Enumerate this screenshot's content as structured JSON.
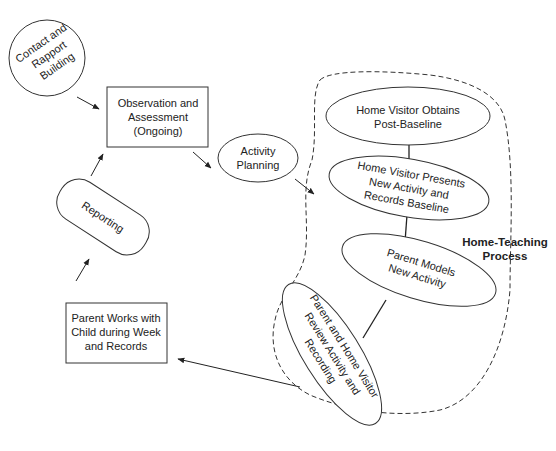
{
  "diagram": {
    "nodes": {
      "contact": {
        "lines": [
          "Contact and",
          "Rapport",
          "Building"
        ]
      },
      "observation": {
        "lines": [
          "Observation and",
          "Assessment",
          "(Ongoing)"
        ]
      },
      "activity_planning": {
        "lines": [
          "Activity",
          "Planning"
        ]
      },
      "reporting": {
        "lines": [
          "Reporting"
        ]
      },
      "parent_works": {
        "lines": [
          "Parent Works with",
          "Child during Week",
          "and Records"
        ]
      },
      "post_baseline": {
        "lines": [
          "Home Visitor Obtains",
          "Post-Baseline"
        ]
      },
      "presents": {
        "lines": [
          "Home Visitor Presents",
          "New Activity and",
          "Records Baseline"
        ]
      },
      "parent_models": {
        "lines": [
          "Parent Models",
          "New Activity"
        ]
      },
      "review": {
        "lines": [
          "Parent and Home Visitor",
          "Review Activity and",
          "Recording"
        ]
      }
    },
    "group_label": {
      "lines": [
        "Home-Teaching",
        "Process"
      ]
    },
    "caption": "",
    "edges": [
      [
        "contact",
        "observation"
      ],
      [
        "observation",
        "activity_planning"
      ],
      [
        "activity_planning",
        "home_teaching_process"
      ],
      [
        "home_teaching_process",
        "parent_works"
      ],
      [
        "parent_works",
        "reporting"
      ],
      [
        "reporting",
        "observation"
      ]
    ]
  }
}
